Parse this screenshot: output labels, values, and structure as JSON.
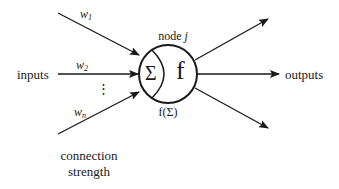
{
  "diagram": {
    "type": "artificial-neuron",
    "inputs_label": "inputs",
    "outputs_label": "outputs",
    "weights": [
      {
        "symbol": "w",
        "subscript": "1"
      },
      {
        "symbol": "w",
        "subscript": "2"
      },
      {
        "symbol": "w",
        "subscript": "n"
      }
    ],
    "ellipsis": "⋮",
    "node": {
      "label_prefix": "node ",
      "label_index": "j",
      "sum_symbol": "Σ",
      "activation_symbol": "f",
      "output_expression": "f(Σ)"
    },
    "connection_label": {
      "line1": "connection",
      "line2": "strength"
    },
    "output_arrow_count": 3,
    "colors": {
      "stroke": "#1a1a1a",
      "background": "#ffffff"
    }
  }
}
